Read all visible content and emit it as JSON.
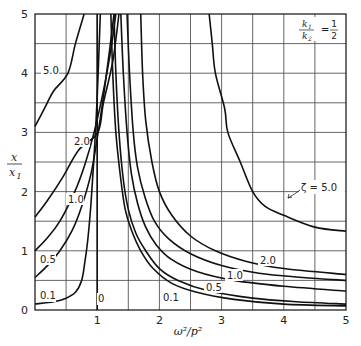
{
  "chart_data": {
    "type": "line",
    "title": "",
    "annotation": "k1/k2 = 1/2",
    "annotation_parts": {
      "num": "k",
      "num_sub": "1",
      "den": "k",
      "den_sub": "2",
      "eq": "=",
      "frac_num": "1",
      "frac_den": "2"
    },
    "xlabel": "ω²/p²",
    "ylabel": "x/x₁",
    "ylabel_parts": {
      "num": "x",
      "den": "x",
      "den_sub": "1"
    },
    "xlim": [
      0,
      5
    ],
    "ylim": [
      0,
      5
    ],
    "xticks": [
      "0",
      "1",
      "2",
      "3",
      "4",
      "5"
    ],
    "yticks": [
      "0",
      "1",
      "2",
      "3",
      "4",
      "5"
    ],
    "grid": true,
    "grid_step": 0.5,
    "legend_position": "inline labels",
    "zeta_label": "ζ = 5.0",
    "series": [
      {
        "name": "0",
        "label": "0",
        "points": [
          [
            0,
            0
          ],
          [
            1,
            0
          ],
          [
            1,
            5
          ]
        ],
        "left": [
          [
            1,
            0
          ],
          [
            1,
            5
          ]
        ],
        "right": [
          [
            1.22,
            5
          ],
          [
            1.25,
            4.0
          ],
          [
            1.3,
            3.0
          ],
          [
            1.38,
            2.2
          ],
          [
            1.45,
            1.7
          ],
          [
            1.55,
            1.35
          ],
          [
            1.7,
            1.0
          ],
          [
            1.9,
            0.7
          ],
          [
            2.2,
            0.45
          ],
          [
            2.6,
            0.3
          ],
          [
            3.2,
            0.18
          ],
          [
            4.0,
            0.1
          ],
          [
            5.0,
            0.07
          ]
        ]
      },
      {
        "name": "0.1",
        "label": "0.1",
        "left": [
          [
            0,
            0.1
          ],
          [
            0.3,
            0.14
          ],
          [
            0.5,
            0.2
          ],
          [
            0.65,
            0.3
          ],
          [
            0.75,
            0.5
          ],
          [
            0.8,
            0.8
          ],
          [
            0.85,
            1.2
          ],
          [
            0.9,
            1.8
          ],
          [
            0.95,
            2.6
          ],
          [
            1.0,
            3.6
          ],
          [
            1.05,
            5.0
          ]
        ],
        "right": [
          [
            1.27,
            5
          ],
          [
            1.3,
            4.0
          ],
          [
            1.35,
            3.0
          ],
          [
            1.42,
            2.2
          ],
          [
            1.5,
            1.7
          ],
          [
            1.62,
            1.3
          ],
          [
            1.78,
            1.0
          ],
          [
            2.0,
            0.7
          ],
          [
            2.3,
            0.5
          ],
          [
            2.8,
            0.32
          ],
          [
            3.5,
            0.2
          ],
          [
            4.2,
            0.14
          ],
          [
            5.0,
            0.1
          ]
        ]
      },
      {
        "name": "0.5",
        "label": "0.5",
        "left": [
          [
            0,
            0.55
          ],
          [
            0.2,
            0.75
          ],
          [
            0.4,
            1.0
          ],
          [
            0.6,
            1.35
          ],
          [
            0.75,
            1.75
          ],
          [
            0.9,
            2.3
          ],
          [
            1.0,
            2.9
          ],
          [
            1.1,
            3.6
          ],
          [
            1.2,
            4.4
          ],
          [
            1.27,
            5.0
          ]
        ],
        "right": [
          [
            1.38,
            5
          ],
          [
            1.42,
            4.0
          ],
          [
            1.48,
            3.0
          ],
          [
            1.55,
            2.3
          ],
          [
            1.65,
            1.8
          ],
          [
            1.78,
            1.4
          ],
          [
            1.95,
            1.1
          ],
          [
            2.2,
            0.85
          ],
          [
            2.6,
            0.65
          ],
          [
            3.2,
            0.5
          ],
          [
            4.0,
            0.4
          ],
          [
            5.0,
            0.32
          ]
        ]
      },
      {
        "name": "1.0",
        "label": "1.0",
        "left": [
          [
            0,
            1.0
          ],
          [
            0.2,
            1.22
          ],
          [
            0.4,
            1.5
          ],
          [
            0.64,
            2.0
          ],
          [
            0.8,
            2.45
          ],
          [
            0.95,
            3.0
          ],
          [
            1.1,
            3.7
          ],
          [
            1.22,
            4.4
          ],
          [
            1.3,
            5.0
          ]
        ],
        "right": [
          [
            1.48,
            5
          ],
          [
            1.52,
            4.0
          ],
          [
            1.58,
            3.0
          ],
          [
            1.65,
            2.4
          ],
          [
            1.77,
            1.9
          ],
          [
            1.92,
            1.5
          ],
          [
            2.15,
            1.2
          ],
          [
            2.5,
            0.95
          ],
          [
            3.0,
            0.75
          ],
          [
            3.6,
            0.62
          ],
          [
            4.3,
            0.55
          ],
          [
            5.0,
            0.5
          ]
        ]
      },
      {
        "name": "2.0",
        "label": "2.0",
        "left": [
          [
            0,
            1.57
          ],
          [
            0.2,
            1.85
          ],
          [
            0.45,
            2.25
          ],
          [
            0.7,
            2.7
          ],
          [
            1.01,
            3.0
          ],
          [
            1.1,
            3.5
          ],
          [
            1.25,
            4.2
          ],
          [
            1.35,
            5.0
          ]
        ],
        "right": [
          [
            1.7,
            5
          ],
          [
            1.73,
            4.0
          ],
          [
            1.78,
            3.2
          ],
          [
            1.88,
            2.5
          ],
          [
            2.0,
            2.0
          ],
          [
            2.2,
            1.6
          ],
          [
            2.5,
            1.25
          ],
          [
            2.9,
            1.0
          ],
          [
            3.4,
            0.82
          ],
          [
            4.0,
            0.7
          ],
          [
            5.0,
            0.6
          ]
        ]
      },
      {
        "name": "5.0",
        "label": "5.0",
        "left": [
          [
            0,
            3.1
          ],
          [
            0.15,
            3.4
          ],
          [
            0.3,
            3.7
          ],
          [
            0.53,
            4.0
          ],
          [
            0.65,
            4.5
          ],
          [
            0.79,
            5.0
          ]
        ],
        "right": [
          [
            2.8,
            5
          ],
          [
            2.85,
            4.5
          ],
          [
            2.9,
            4.0
          ],
          [
            3.05,
            3.4
          ],
          [
            3.1,
            3.0
          ],
          [
            3.3,
            2.5
          ],
          [
            3.5,
            2.0
          ],
          [
            3.7,
            1.75
          ],
          [
            4.0,
            1.6
          ],
          [
            4.5,
            1.4
          ],
          [
            5.0,
            1.33
          ]
        ]
      }
    ]
  }
}
